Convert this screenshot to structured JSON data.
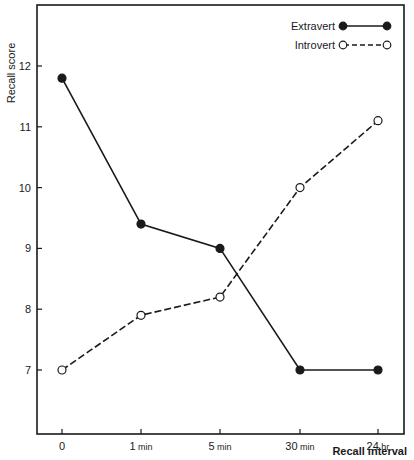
{
  "chart_data": {
    "type": "line",
    "title": "",
    "xlabel": "Recall interval",
    "ylabel": "Recall score",
    "categories": [
      "0",
      "1 min",
      "5 min",
      "30 min",
      "24 hr"
    ],
    "x_tick_labels": [
      {
        "num": "0",
        "unit": ""
      },
      {
        "num": "1",
        "unit": "min"
      },
      {
        "num": "5",
        "unit": "min"
      },
      {
        "num": "30",
        "unit": "min"
      },
      {
        "num": "24",
        "unit": "hr"
      }
    ],
    "y_ticks": [
      7,
      8,
      9,
      10,
      11,
      12
    ],
    "ylim": [
      6.0,
      13.0
    ],
    "grid": false,
    "legend_position": "upper right",
    "series": [
      {
        "name": "Extravert",
        "marker": "filled-circle",
        "line": "solid",
        "values": [
          11.8,
          9.4,
          9.0,
          7.0,
          7.0
        ]
      },
      {
        "name": "Introvert",
        "marker": "open-circle",
        "line": "dashed",
        "values": [
          7.0,
          7.9,
          8.2,
          10.0,
          11.1
        ]
      }
    ]
  }
}
